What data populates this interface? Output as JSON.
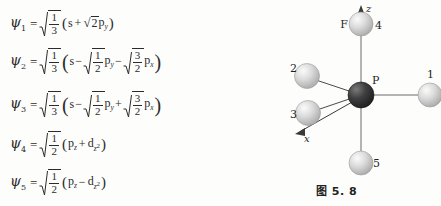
{
  "equations": [
    {
      "id": "psi-1",
      "lhs": "ψ",
      "index": "1",
      "equals": "=",
      "coefficient": {
        "numerator": "1",
        "denominator": "3"
      },
      "open_paren": "(",
      "terms": [
        {
          "sign": "",
          "orbital": "s"
        },
        {
          "sign": "+",
          "sqrt_value": "2",
          "orbital": "p",
          "subscript": "y"
        }
      ],
      "close_paren": ")"
    },
    {
      "id": "psi-2",
      "lhs": "ψ",
      "index": "2",
      "equals": "=",
      "coefficient": {
        "numerator": "1",
        "denominator": "3"
      },
      "open_paren": "(",
      "terms": [
        {
          "sign": "",
          "orbital": "s"
        },
        {
          "sign": "−",
          "fraction": {
            "numerator": "1",
            "denominator": "2"
          },
          "orbital": "p",
          "subscript": "y"
        },
        {
          "sign": "−",
          "fraction": {
            "numerator": "3",
            "denominator": "2"
          },
          "orbital": "p",
          "subscript": "x"
        }
      ],
      "close_paren": ")"
    },
    {
      "id": "psi-3",
      "lhs": "ψ",
      "index": "3",
      "equals": "=",
      "coefficient": {
        "numerator": "1",
        "denominator": "3"
      },
      "open_paren": "(",
      "terms": [
        {
          "sign": "",
          "orbital": "s"
        },
        {
          "sign": "−",
          "fraction": {
            "numerator": "1",
            "denominator": "2"
          },
          "orbital": "p",
          "subscript": "y"
        },
        {
          "sign": "+",
          "fraction": {
            "numerator": "3",
            "denominator": "2"
          },
          "orbital": "p",
          "subscript": "x"
        }
      ],
      "close_paren": ")"
    },
    {
      "id": "psi-4",
      "lhs": "ψ",
      "index": "4",
      "equals": "=",
      "coefficient": {
        "numerator": "1",
        "denominator": "2"
      },
      "open_paren": "(",
      "terms": [
        {
          "sign": "",
          "orbital": "p",
          "subscript": "z"
        },
        {
          "sign": "+",
          "orbital": "d",
          "subscript": "z",
          "superscript": "2"
        }
      ],
      "close_paren": ")"
    },
    {
      "id": "psi-5",
      "lhs": "ψ",
      "index": "5",
      "equals": "=",
      "coefficient": {
        "numerator": "1",
        "denominator": "2"
      },
      "open_paren": "(",
      "terms": [
        {
          "sign": "",
          "orbital": "p",
          "subscript": "z"
        },
        {
          "sign": "−",
          "orbital": "d",
          "subscript": "z",
          "superscript": "2"
        }
      ],
      "close_paren": ")"
    }
  ],
  "figure": {
    "caption": "图 5. 8",
    "central_atom": {
      "label": "P"
    },
    "element_label": "F",
    "axes": [
      {
        "name": "z-axis",
        "label": "z"
      },
      {
        "name": "x-axis",
        "label": "x"
      }
    ],
    "ligands": [
      {
        "label": "1",
        "position": "right-equatorial"
      },
      {
        "label": "2",
        "position": "upper-left-equatorial"
      },
      {
        "label": "3",
        "position": "lower-left-equatorial"
      },
      {
        "label": "4",
        "position": "top-axial"
      },
      {
        "label": "5",
        "position": "bottom-axial"
      }
    ]
  },
  "colors": {
    "background": "#fdfdfc",
    "ink": "#2b2b2b",
    "central_atom": "#3a3a3a",
    "ligand_atom": "#c9c9c9",
    "bond": "#5a5a5a"
  }
}
